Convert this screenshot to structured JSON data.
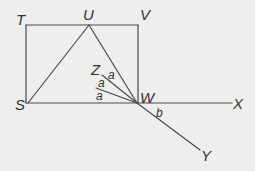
{
  "diagram": {
    "type": "geometry",
    "colors": {
      "background": "#eeeeec",
      "stroke": "#4a4a4a",
      "text": "#333333"
    },
    "points": {
      "T": {
        "label": "T"
      },
      "U": {
        "label": "U"
      },
      "V": {
        "label": "V"
      },
      "S": {
        "label": "S"
      },
      "W": {
        "label": "W"
      },
      "X": {
        "label": "X"
      },
      "Y": {
        "label": "Y"
      },
      "Z": {
        "label": "Z"
      }
    },
    "angle_labels": {
      "a1": "a",
      "a2": "a",
      "a3": "a",
      "b": "b"
    },
    "segments": [
      "TV",
      "TS",
      "VW",
      "SW",
      "WX",
      "SU",
      "UW",
      "WY",
      "WZ",
      "W-ray-between"
    ]
  }
}
